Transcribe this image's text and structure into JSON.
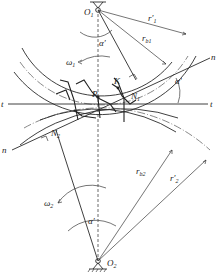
{
  "diagram": {
    "type": "gear-meshing-geometry",
    "labels": {
      "O1": "O",
      "O1_sub": "1",
      "O2": "O",
      "O2_sub": "2",
      "r1_prime": "r′",
      "r1_prime_sub": "1",
      "rb1": "r",
      "rb1_sub": "b1",
      "rb2": "r",
      "rb2_sub": "b2",
      "r2_prime": "r′",
      "r2_prime_sub": "2",
      "alpha_top": "α′",
      "alpha_right": "α′",
      "alpha_bottom": "α′",
      "omega1": "ω",
      "omega1_sub": "1",
      "omega2": "ω",
      "omega2_sub": "2",
      "n_right": "n",
      "n_left": "n",
      "t_left": "t",
      "t_right": "t",
      "K": "K",
      "P": "P",
      "N1": "N",
      "N1_sub": "1",
      "N2": "N",
      "N2_sub": "2"
    },
    "colors": {
      "line": "#2a2a2a",
      "background": "#ffffff"
    }
  }
}
